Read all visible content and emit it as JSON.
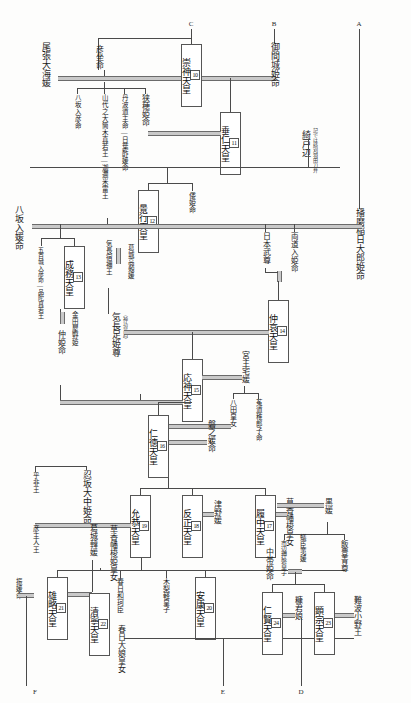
{
  "meta": {
    "orientation": "vertical-japanese",
    "line_color": "#4a4a4a",
    "marriage_line_color": "#c9c9c9",
    "text_color": "#1c1c1c"
  },
  "connectors": {
    "a_top": "A",
    "b_top": "B",
    "c_top": "C",
    "d_bottom": "D",
    "e_bottom": "E",
    "f_bottom": "F"
  },
  "emperors": [
    {
      "num": "10",
      "name": "崇神天皇"
    },
    {
      "num": "11",
      "name": "垂仁天皇"
    },
    {
      "num": "12",
      "name": "景行天皇"
    },
    {
      "num": "13",
      "name": "成務天皇"
    },
    {
      "num": "14",
      "name": "仲哀天皇"
    },
    {
      "num": "15",
      "name": "応神天皇"
    },
    {
      "num": "16",
      "name": "仁徳天皇"
    },
    {
      "num": "17",
      "name": "履中天皇"
    },
    {
      "num": "18",
      "name": "反正天皇"
    },
    {
      "num": "19",
      "name": "允恭天皇"
    },
    {
      "num": "20",
      "name": "安康天皇"
    },
    {
      "num": "21",
      "name": "雄略天皇"
    },
    {
      "num": "22",
      "name": "清寧天皇"
    },
    {
      "num": "23",
      "name": "顕宗天皇"
    },
    {
      "num": "24",
      "name": "仁賢天皇"
    }
  ],
  "consorts": [
    {
      "id": "owari",
      "label": "尾張大海媛"
    },
    {
      "id": "mimaki",
      "label": "御間城姫命"
    },
    {
      "id": "harima",
      "label": "播磨稲日大郎姫命"
    },
    {
      "id": "kajitobe",
      "label": "綺戸辺"
    },
    {
      "id": "sahoji",
      "label": "狭穂姫命"
    },
    {
      "id": "yasakairi",
      "label": "八坂入媛命"
    },
    {
      "id": "kanadaya",
      "label": "金田屋野姫"
    },
    {
      "id": "nakatsu",
      "label": "仲姫命"
    },
    {
      "id": "okinaga",
      "label": "気長足姫尊"
    },
    {
      "id": "miyanushi",
      "label": "宮主宅媛"
    },
    {
      "id": "iwanohime",
      "label": "磐之媛命"
    },
    {
      "id": "tsunohime",
      "label": "津野媛"
    },
    {
      "id": "kusaka",
      "label": "草香幡梭姫皇女"
    },
    {
      "id": "kusaka2",
      "label": "草香幡梭皇女"
    },
    {
      "id": "osaka",
      "label": "忍坂大中姫命"
    },
    {
      "id": "katsuragi_kara",
      "label": "葛城韓媛"
    },
    {
      "id": "kurohime",
      "label": "黒媛"
    },
    {
      "id": "nakatarashi",
      "label": "中帯姫命"
    },
    {
      "id": "arinomi",
      "label": "蟻臣荑媛"
    },
    {
      "id": "nukakimi",
      "label": "糠君娘"
    },
    {
      "id": "naniwa",
      "label": "難波小野王"
    },
    {
      "id": "furihime",
      "label": "振媛命"
    },
    {
      "id": "katsuragi_taka",
      "label": "葛城高顙媛"
    },
    {
      "id": "kasuga_wani",
      "label": "春日和珂臣"
    },
    {
      "id": "kasuga_ohiratsume",
      "label": "春日大娘皇女"
    }
  ],
  "princes": [
    {
      "id": "hikoza",
      "label": "彦坐命"
    },
    {
      "id": "yasaka_h",
      "label": "八坂入彦命"
    },
    {
      "id": "yamashiro",
      "label": "山代之大筒木真若王―迦邇米雷王"
    },
    {
      "id": "tanba",
      "label": "丹波道主命―日葉酢媛命"
    },
    {
      "id": "yamatohime",
      "label": "倭姫命"
    },
    {
      "id": "iokiiri",
      "label": "五百城入彦命―品陀真若王"
    },
    {
      "id": "okinaga_sukune",
      "label": "気長宿禰王"
    },
    {
      "id": "yamatotakeru",
      "label": "日本武尊"
    },
    {
      "id": "futaji",
      "label": "両道入姫命"
    },
    {
      "id": "yatanohime",
      "label": "八田皇女"
    },
    {
      "id": "ujinowaki",
      "label": "菟道稚郎子命"
    },
    {
      "id": "kinashi",
      "label": "木梨軽皇子"
    },
    {
      "id": "ichinobe",
      "label": "市辺押磐皇子"
    },
    {
      "id": "iitoyo",
      "label": "飯豊青尊"
    },
    {
      "id": "oohodo",
      "label": "意富々杼王"
    },
    {
      "id": "ohi",
      "label": "乎非王"
    },
    {
      "id": "hikoushi",
      "label": "彦主人王"
    }
  ],
  "annotations": [
    {
      "id": "jingu_note",
      "label": "（神功皇后）"
    },
    {
      "id": "kojiki_note",
      "label": "記では綺刈羽田刀弁"
    }
  ]
}
